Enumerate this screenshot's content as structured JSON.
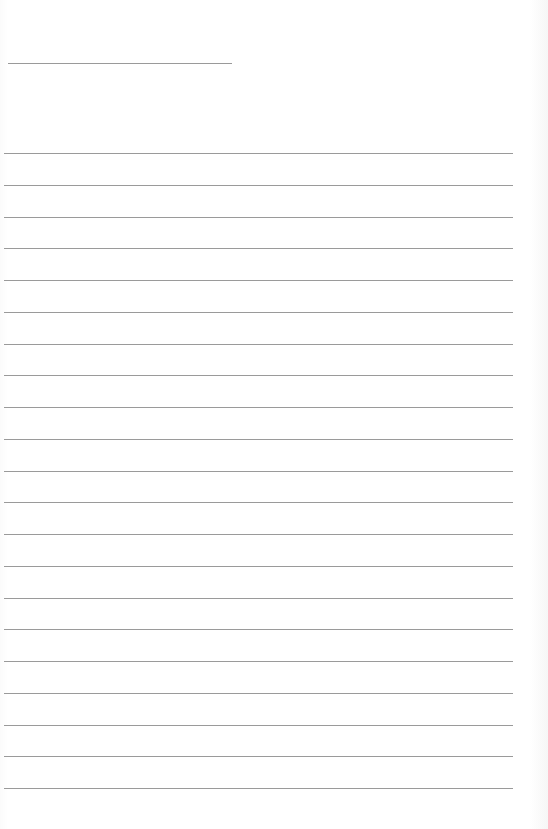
{
  "document": {
    "type": "lined-paper",
    "header_rule": {
      "top": 63,
      "left": 8,
      "width": 224
    },
    "ruled_lines": {
      "count": 21,
      "first_top": 153,
      "spacing": 31.75,
      "left": 4,
      "width": 509,
      "color": "#9a9a9a"
    }
  }
}
